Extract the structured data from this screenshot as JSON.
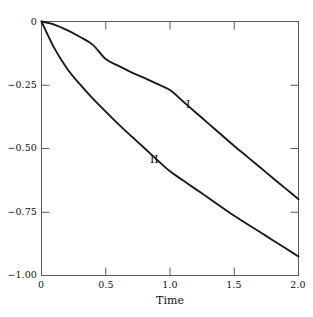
{
  "chart_data": {
    "type": "line",
    "title": "",
    "subtitle": "",
    "xlabel": "Time",
    "ylabel": "",
    "xlim": [
      0,
      2.0
    ],
    "ylim": [
      -1.0,
      0
    ],
    "grid": false,
    "legend": "inline-annotations",
    "frame": "box",
    "tick_direction": "in",
    "xticks": [
      0,
      0.5,
      1.0,
      1.5,
      2.0
    ],
    "xtick_labels": [
      "0",
      "0.5",
      "1.0",
      "1.5",
      "2.0"
    ],
    "yticks": [
      0,
      -0.25,
      -0.5,
      -0.75,
      -1.0
    ],
    "ytick_labels": [
      "0",
      "−0.25",
      "−0.50",
      "−0.75",
      "−1.00"
    ],
    "x": [
      0,
      0.1,
      0.2,
      0.3,
      0.4,
      0.5,
      0.6,
      0.7,
      0.8,
      0.9,
      1.0,
      1.1,
      1.2,
      1.3,
      1.4,
      1.5,
      1.6,
      1.7,
      1.8,
      1.9,
      2.0
    ],
    "series": [
      {
        "name": "I",
        "label": "I",
        "annotation": "I",
        "color": "#1a1a1a",
        "values": [
          0,
          -0.012,
          -0.034,
          -0.061,
          -0.092,
          -0.148,
          -0.175,
          -0.2,
          -0.222,
          -0.246,
          -0.27,
          -0.314,
          -0.358,
          -0.402,
          -0.446,
          -0.49,
          -0.532,
          -0.574,
          -0.616,
          -0.658,
          -0.7
        ]
      },
      {
        "name": "II",
        "label": "II",
        "annotation": "II",
        "color": "#1a1a1a",
        "values": [
          0,
          -0.105,
          -0.186,
          -0.248,
          -0.304,
          -0.355,
          -0.405,
          -0.452,
          -0.498,
          -0.545,
          -0.59,
          -0.625,
          -0.66,
          -0.695,
          -0.73,
          -0.765,
          -0.797,
          -0.829,
          -0.861,
          -0.893,
          -0.925
        ]
      }
    ],
    "annotations": [
      {
        "text": "I",
        "x": 1.29,
        "y": -0.32
      },
      {
        "text": "II",
        "x": 0.81,
        "y": -0.545
      }
    ]
  }
}
